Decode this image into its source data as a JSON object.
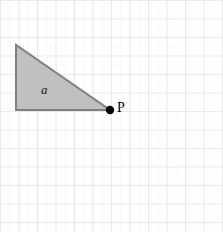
{
  "figure": {
    "canvas": {
      "width": 223,
      "height": 232,
      "background": "#ffffff"
    },
    "grid": {
      "major_spacing": 18.5,
      "minor_spacing": 9.25,
      "major_color": "#d9d9d9",
      "minor_color": "#f0f0f0",
      "visible": true
    },
    "triangle": {
      "label": "a",
      "label_position": {
        "x": 41,
        "y": 83
      },
      "fill_color": "#c0c0c0",
      "stroke_color": "#808080",
      "stroke_width": 2,
      "vertices": [
        {
          "name": "top-left",
          "x": 16,
          "y": 45
        },
        {
          "name": "bottom-left",
          "x": 16,
          "y": 110
        },
        {
          "name": "point-p",
          "x": 110,
          "y": 110
        }
      ]
    },
    "point": {
      "label": "P",
      "label_position": {
        "x": 117,
        "y": 101
      },
      "marker_color": "#000000",
      "marker_radius": 4,
      "x": 110,
      "y": 110
    }
  }
}
